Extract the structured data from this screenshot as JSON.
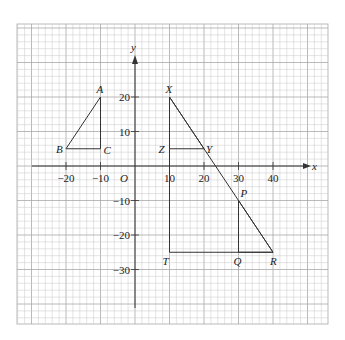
{
  "diagram": {
    "type": "coordinate-grid",
    "axes": {
      "x_label": "x",
      "y_label": "y",
      "origin_label": "O",
      "x_ticks": [
        {
          "value": -20,
          "label": "−20"
        },
        {
          "value": -10,
          "label": "−10"
        },
        {
          "value": 10,
          "label": "10"
        },
        {
          "value": 20,
          "label": "20"
        },
        {
          "value": 30,
          "label": "30"
        },
        {
          "value": 40,
          "label": "40"
        }
      ],
      "y_ticks": [
        {
          "value": 20,
          "label": "20"
        },
        {
          "value": 10,
          "label": "10"
        },
        {
          "value": -10,
          "label": "−10"
        },
        {
          "value": -20,
          "label": "−20"
        },
        {
          "value": -30,
          "label": "−30"
        }
      ]
    },
    "points": {
      "A": {
        "label": "A",
        "x": -10,
        "y": 20
      },
      "B": {
        "label": "B",
        "x": -20,
        "y": 5
      },
      "C": {
        "label": "C",
        "x": -10,
        "y": 5
      },
      "X": {
        "label": "X",
        "x": 10,
        "y": 20
      },
      "Y": {
        "label": "Y",
        "x": 20,
        "y": 5
      },
      "Z": {
        "label": "Z",
        "x": 10,
        "y": 5
      },
      "P": {
        "label": "P",
        "x": 30,
        "y": -10
      },
      "Q": {
        "label": "Q",
        "x": 30,
        "y": -25
      },
      "R": {
        "label": "R",
        "x": 40,
        "y": -25
      },
      "T": {
        "label": "T",
        "x": 10,
        "y": -25
      }
    },
    "shapes": [
      {
        "name": "triangle ABC",
        "vertices": [
          "A",
          "B",
          "C"
        ]
      },
      {
        "name": "triangle XYZ",
        "vertices": [
          "X",
          "Y",
          "Z"
        ]
      },
      {
        "name": "triangle PQR",
        "vertices": [
          "P",
          "Q",
          "R"
        ]
      },
      {
        "name": "triangle XTR",
        "vertices": [
          "X",
          "T",
          "R"
        ]
      }
    ],
    "colors": {
      "grid_minor": "#c8c8c8",
      "grid_major": "#a8a8a8",
      "line": "#333333"
    }
  }
}
